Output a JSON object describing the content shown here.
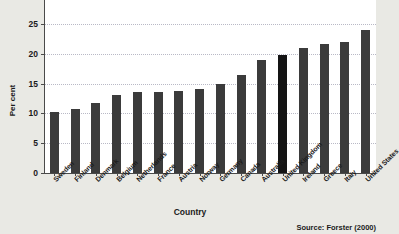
{
  "chart_data": {
    "type": "bar",
    "title": "",
    "xlabel": "Country",
    "ylabel": "Per cent",
    "ylim": [
      0,
      30
    ],
    "yticks": [
      0,
      5,
      10,
      15,
      20,
      25,
      30
    ],
    "grid": true,
    "legend": null,
    "categories": [
      "Sweden",
      "Finland",
      "Denmark",
      "Belgium",
      "Netherlands",
      "France",
      "Austria",
      "Norway",
      "Germany",
      "Canada",
      "Australia",
      "United Kingdom",
      "Ireland",
      "Greece",
      "Italy",
      "United States"
    ],
    "values": [
      10.2,
      10.7,
      11.8,
      13.0,
      13.5,
      13.5,
      13.7,
      14.0,
      15.0,
      16.4,
      18.9,
      19.7,
      21.0,
      21.6,
      21.9,
      24.0
    ],
    "highlight_category": "United Kingdom",
    "bar_color": "#3b3b3b",
    "highlight_color": "#141414",
    "grid_color": "#b9b9c6",
    "panel_color": "#ffffff",
    "figure_color": "#e9e9e4"
  },
  "annotations": {
    "source": "Source: Forster (2000)"
  }
}
